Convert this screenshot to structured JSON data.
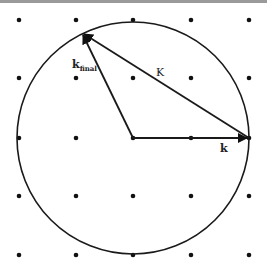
{
  "diagram": {
    "colors": {
      "line": "#1a1a1a",
      "dot": "#111111",
      "border": "#9a9a9a",
      "background": "#ffffff"
    },
    "lattice": {
      "xs": [
        19,
        76,
        133,
        191,
        249
      ],
      "ys": [
        20,
        78,
        138,
        196,
        255
      ]
    },
    "circle": {
      "cx": 133,
      "cy": 138,
      "r": 116
    },
    "vectors": [
      {
        "name": "k",
        "label": "k",
        "from": [
          133,
          138
        ],
        "to": [
          249,
          138
        ]
      },
      {
        "name": "k-final",
        "label": "k",
        "sub": "final",
        "from": [
          133,
          138
        ],
        "to": [
          82,
          33
        ]
      },
      {
        "name": "K",
        "label": "K",
        "from": [
          249,
          138
        ],
        "to": [
          82,
          33
        ]
      }
    ],
    "labels": {
      "k": "k",
      "k_final_main": "k",
      "k_final_sub": "final",
      "K": "K"
    }
  }
}
